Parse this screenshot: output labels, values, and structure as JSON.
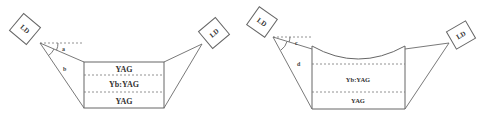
{
  "left_diagram": {
    "source_left": {
      "label": "LD"
    },
    "source_right": {
      "label": "LD"
    },
    "angles": {
      "a": "a",
      "b": "b"
    },
    "layers": [
      {
        "label": "YAG"
      },
      {
        "label": "Yb:YAG"
      },
      {
        "label": "YAG"
      }
    ]
  },
  "right_diagram": {
    "source_left": {
      "label": "LD"
    },
    "source_right": {
      "label": "LD"
    },
    "angles": {
      "c": "c",
      "d": "d"
    },
    "layers": [
      {
        "label": "Yb:YAG"
      },
      {
        "label": "YAG"
      }
    ]
  },
  "colors": {
    "line": "#6a6a6a",
    "text": "#333333",
    "background": "#ffffff"
  }
}
